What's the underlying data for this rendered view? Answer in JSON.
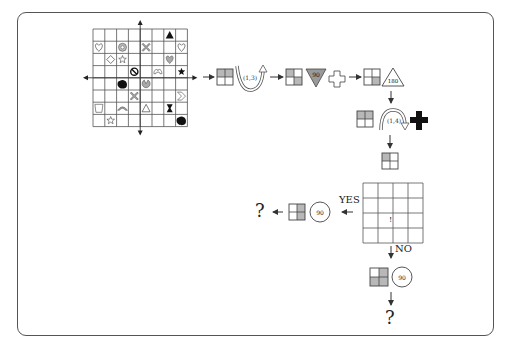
{
  "grid": {
    "rows": 8,
    "cols": 8,
    "cells": [
      {
        "r": 0,
        "c": 6,
        "icon": "filled-triangle"
      },
      {
        "r": 1,
        "c": 0,
        "icon": "outline-heart"
      },
      {
        "r": 1,
        "c": 2,
        "icon": "gray-flower"
      },
      {
        "r": 1,
        "c": 4,
        "icon": "gray-x-cross"
      },
      {
        "r": 1,
        "c": 7,
        "icon": "outline-heart"
      },
      {
        "r": 2,
        "c": 1,
        "icon": "outline-diamond"
      },
      {
        "r": 2,
        "c": 2,
        "icon": "outline-star"
      },
      {
        "r": 2,
        "c": 6,
        "icon": "gray-heart"
      },
      {
        "r": 3,
        "c": 3,
        "icon": "prohibited-sign"
      },
      {
        "r": 3,
        "c": 5,
        "icon": "outline-arch-heart"
      },
      {
        "r": 3,
        "c": 7,
        "icon": "filled-star"
      },
      {
        "r": 4,
        "c": 2,
        "icon": "filled-blob"
      },
      {
        "r": 4,
        "c": 4,
        "icon": "gray-pacman"
      },
      {
        "r": 5,
        "c": 3,
        "icon": "gray-x-cross"
      },
      {
        "r": 5,
        "c": 7,
        "icon": "outline-chevron"
      },
      {
        "r": 6,
        "c": 0,
        "icon": "outline-cup"
      },
      {
        "r": 6,
        "c": 2,
        "icon": "gray-arch"
      },
      {
        "r": 6,
        "c": 4,
        "icon": "outline-triangle"
      },
      {
        "r": 6,
        "c": 6,
        "icon": "filled-hourglass"
      },
      {
        "r": 7,
        "c": 1,
        "icon": "outline-star"
      },
      {
        "r": 7,
        "c": 7,
        "icon": "filled-blob"
      }
    ]
  },
  "flow": {
    "step1": {
      "rotate_label": "(1,3)"
    },
    "step2": {
      "triangle_label": "90"
    },
    "step3": {
      "triangle_label": "180"
    },
    "step4": {
      "rotate_label": "(1,4)"
    },
    "check_grid": {
      "rows": 4,
      "cols": 4,
      "mark": "!"
    },
    "yes_branch": {
      "label": "YES",
      "circle_label": "90",
      "result": "?"
    },
    "no_branch": {
      "label": "NO",
      "circle_label": "90",
      "result": "?"
    }
  },
  "colors": {
    "line": "#444444",
    "gray_fill": "#b8b8b8",
    "dark_fill": "#111111"
  }
}
